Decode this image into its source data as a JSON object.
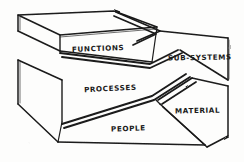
{
  "diagram": {
    "type": "hand-drawn-sketch",
    "background_color": "#fdfdfc",
    "ink_color": "#1a1a1a",
    "segments": [
      {
        "id": "functions",
        "label": "FUNCTIONS",
        "position": "top-left-slab"
      },
      {
        "id": "sub-systems",
        "label": "SUB-SYSTEMS",
        "position": "top-right-wedge"
      },
      {
        "id": "processes",
        "label": "PROCESSES",
        "position": "middle-left-body"
      },
      {
        "id": "material",
        "label": "MATERIAL",
        "position": "lower-right-wedge"
      },
      {
        "id": "people",
        "label": "PEOPLE",
        "position": "bottom-center-wedge"
      }
    ]
  }
}
